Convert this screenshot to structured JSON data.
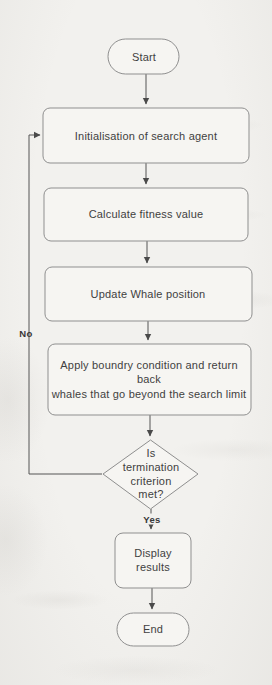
{
  "flowchart": {
    "title": "Whale Optimization Algorithm flowchart",
    "nodes": {
      "start": {
        "label": "Start"
      },
      "init": {
        "label": "Initialisation of search agent"
      },
      "fitness": {
        "label": "Calculate fitness value"
      },
      "update": {
        "label": "Update Whale position"
      },
      "boundary": {
        "label": "Apply boundry condition and return back\nwhales that go beyond the search limit"
      },
      "decision": {
        "label": "Is\ntermination\ncriterion\nmet?"
      },
      "display": {
        "label": "Display\nresults"
      },
      "end": {
        "label": "End"
      }
    },
    "edge_labels": {
      "yes": "Yes",
      "no": "No"
    },
    "colors": {
      "paper": "#f2f1ee",
      "shape_fill": "#f6f5f2",
      "shape_border": "#8f8f8f",
      "connector": "#4f4f4f",
      "text": "#3f3f3f"
    }
  }
}
